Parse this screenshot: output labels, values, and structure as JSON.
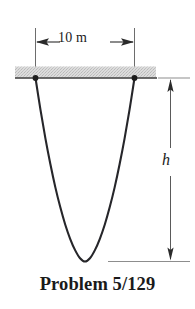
{
  "figure": {
    "caption": "Problem 5/129",
    "dimensions": {
      "width_label": "10 m",
      "height_label": "h"
    },
    "colors": {
      "background": "#ffffff",
      "cable": "#26262a",
      "support_bar_fill": "#d8d8d8",
      "support_bar_edge": "#3a3a3a",
      "dimension_line": "#4a4a4a",
      "reference_line": "#8d8d8d",
      "text": "#1a1a1a"
    }
  },
  "chart_data": {
    "type": "line",
    "title": "Problem 5/129",
    "subtitle": "",
    "xlabel": "",
    "ylabel": "",
    "annotations": [
      {
        "name": "span-dimension",
        "text": "10 m",
        "kind": "horizontal-dimension",
        "from_x": 0,
        "to_x": 10,
        "units": "m"
      },
      {
        "name": "sag-dimension",
        "text": "h",
        "kind": "vertical-dimension",
        "units": ""
      }
    ],
    "legend": [],
    "grid": false,
    "series": [
      {
        "name": "cable",
        "kind": "catenary",
        "x": [
          0.0,
          0.5,
          1.0,
          1.5,
          2.0,
          2.5,
          3.0,
          3.5,
          4.0,
          4.5,
          5.0,
          5.5,
          6.0,
          6.5,
          7.0,
          7.5,
          8.0,
          8.5,
          9.0,
          9.5,
          10.0
        ],
        "y": [
          0.0,
          1.95,
          3.72,
          5.3,
          6.72,
          7.95,
          9.02,
          9.9,
          10.6,
          11.1,
          11.3,
          11.1,
          10.6,
          9.9,
          9.02,
          7.95,
          6.72,
          5.3,
          3.72,
          1.95,
          0.0
        ],
        "note": "y measured downward from the support line; maximum sag equals h"
      }
    ],
    "points": [
      {
        "name": "left-support",
        "x": 0,
        "y": 0
      },
      {
        "name": "right-support",
        "x": 10,
        "y": 0
      }
    ],
    "xlim": [
      0,
      10
    ],
    "ylim": [
      0,
      11.3
    ]
  }
}
